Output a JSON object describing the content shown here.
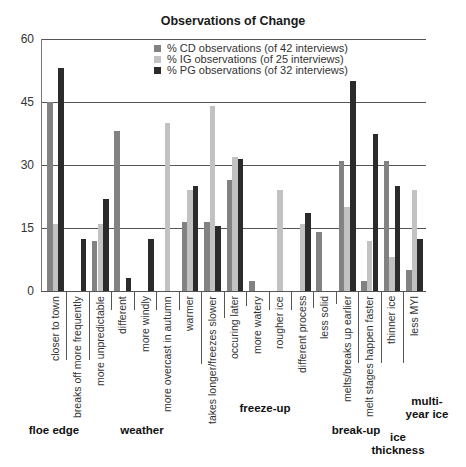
{
  "chart_data": {
    "type": "bar",
    "title": "Observations of Change",
    "xlabel": "",
    "ylabel": "",
    "ylim": [
      0,
      60
    ],
    "yticks": [
      0,
      15,
      30,
      45,
      60
    ],
    "grid": true,
    "legend_position": "top-center inside plot",
    "categories": [
      "closer to town",
      "breaks off more frequently",
      "more unpredictable",
      "different",
      "more windly",
      "more overcast in autumn",
      "warmer",
      "takes longer/freezes slower",
      "occuring later",
      "more watery",
      "rougher ice",
      "different process",
      "less solid",
      "melts/breaks up earlier",
      "melt stages happen faster",
      "thinner ice",
      "less MYI"
    ],
    "groups": [
      {
        "label": "floe edge",
        "categories": [
          "closer to town",
          "breaks off more frequently"
        ]
      },
      {
        "label": "weather",
        "categories": [
          "more unpredictable",
          "different",
          "more windly",
          "more overcast in autumn",
          "warmer"
        ]
      },
      {
        "label": "freeze-up",
        "categories": [
          "takes longer/freezes slower",
          "occuring later",
          "more watery",
          "rougher ice",
          "different process",
          "less solid"
        ]
      },
      {
        "label": "break-up",
        "categories": [
          "melts/breaks up earlier",
          "melt stages happen faster"
        ]
      },
      {
        "label": "ice thickness",
        "categories": [
          "thinner ice"
        ]
      },
      {
        "label": "multi-year ice",
        "categories": [
          "less MYI"
        ]
      }
    ],
    "series": [
      {
        "name": "% CD observations (of 42 interviews)",
        "color": "#828282",
        "values": [
          45,
          0,
          12,
          38,
          0,
          0,
          16.5,
          16.5,
          26.5,
          2.5,
          0,
          0,
          14,
          31,
          2.5,
          31,
          5
        ]
      },
      {
        "name": "% IG observations (of 25 interviews)",
        "color": "#c2c2c2",
        "values": [
          16,
          0,
          16,
          0,
          0,
          40,
          24,
          44,
          32,
          0,
          24,
          16,
          0,
          20,
          12,
          8,
          24
        ]
      },
      {
        "name": "% PG observations (of 32 interviews)",
        "color": "#2b2b2b",
        "values": [
          53,
          12.5,
          22,
          3,
          12.5,
          0,
          25,
          15.5,
          31.5,
          0,
          0,
          18.5,
          0,
          50,
          37.5,
          25,
          12.5
        ]
      }
    ]
  },
  "labels": {
    "group_labels": [
      {
        "text": "floe edge"
      },
      {
        "text": "weather"
      },
      {
        "text": "freeze-up"
      },
      {
        "text": "break-up"
      },
      {
        "line1": "ice",
        "line2": "thickness"
      },
      {
        "line1": "multi-",
        "line2": "year ice"
      }
    ]
  }
}
